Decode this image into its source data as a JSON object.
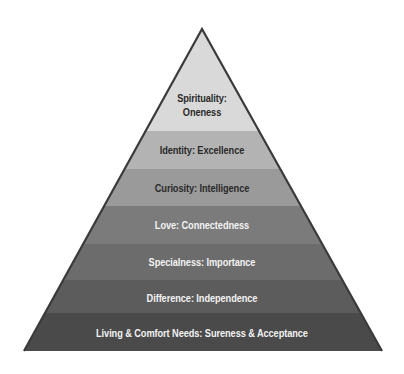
{
  "diagram": {
    "type": "pyramid",
    "levels": [
      {
        "label_line1": "Spirituality:",
        "label_line2": "Oneness",
        "fill": "#d9d9d9",
        "text_color": "dark"
      },
      {
        "label": "Identity: Excellence",
        "fill": "#b3b3b3",
        "text_color": "dark"
      },
      {
        "label": "Curiosity: Intelligence",
        "fill": "#9a9a9a",
        "text_color": "dark"
      },
      {
        "label": "Love: Connectedness",
        "fill": "#7b7b7b",
        "text_color": "light"
      },
      {
        "label": "Specialness: Importance",
        "fill": "#6c6c6c",
        "text_color": "light"
      },
      {
        "label": "Difference: Independence",
        "fill": "#5c5c5c",
        "text_color": "light"
      },
      {
        "label": "Living & Comfort Needs: Sureness & Acceptance",
        "fill": "#4a4a4a",
        "text_color": "light"
      }
    ],
    "outline_color": "#3a3a3a"
  }
}
